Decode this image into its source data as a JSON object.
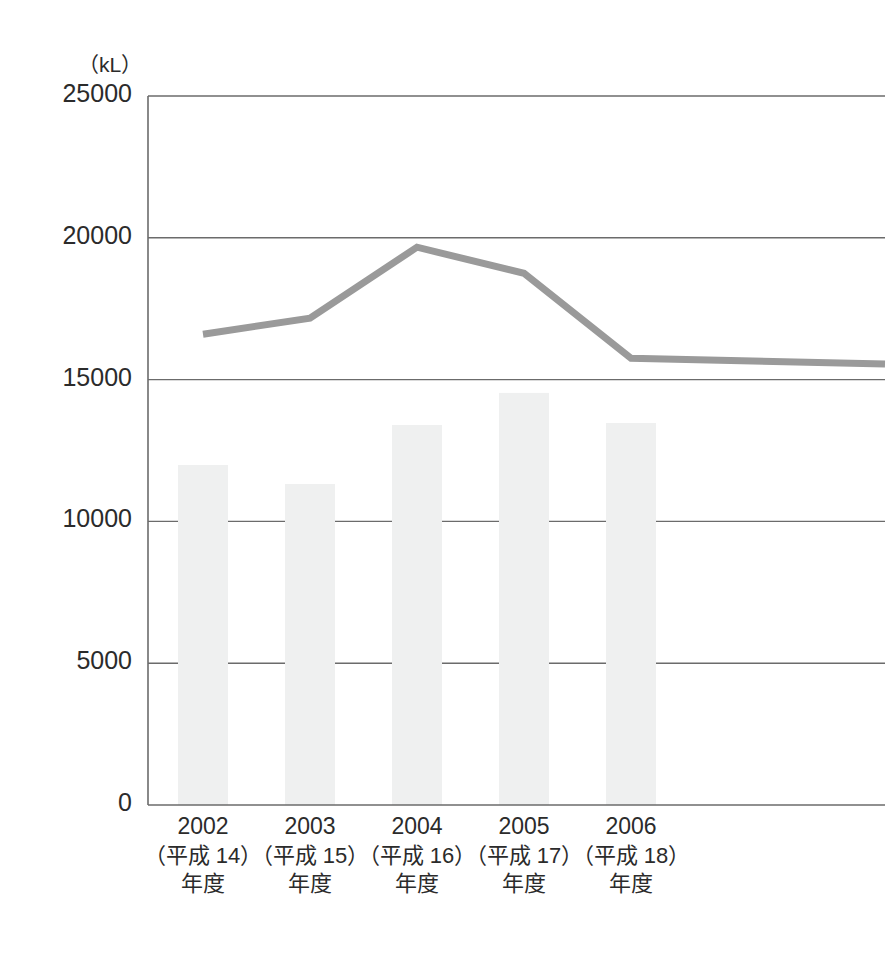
{
  "chart_data": {
    "type": "bar",
    "title": "",
    "subtitle": "",
    "xlabel": "",
    "ylabel": "",
    "unit_label": "（kL）",
    "grid": true,
    "legend_position": "none",
    "ylim": [
      0,
      25000
    ],
    "ytick_values": [
      0,
      5000,
      10000,
      15000,
      20000,
      25000
    ],
    "ytick_labels": [
      "0",
      "5000",
      "10000",
      "15000",
      "20000",
      "25000"
    ],
    "categories": [
      "2002",
      "2003",
      "2004",
      "2005",
      "2006"
    ],
    "category_labels": [
      {
        "year": "2002",
        "era": "（平成 14）",
        "suffix": "年度"
      },
      {
        "year": "2003",
        "era": "（平成 15）",
        "suffix": "年度"
      },
      {
        "year": "2004",
        "era": "（平成 16）",
        "suffix": "年度"
      },
      {
        "year": "2005",
        "era": "（平成 17）",
        "suffix": "年度"
      },
      {
        "year": "2006",
        "era": "（平成 18）",
        "suffix": "年度"
      }
    ],
    "series": [
      {
        "name": "bars",
        "render": "bar",
        "color": "#eff0f0",
        "values": [
          11990,
          11320,
          13400,
          14530,
          13470
        ]
      },
      {
        "name": "line",
        "render": "line",
        "color": "#9a9a9a",
        "width": 7,
        "values": [
          16600,
          17170,
          19670,
          18750,
          15750
        ],
        "trailing_value": 15550
      }
    ],
    "colors": {
      "bar_fill": "#eff0f0",
      "line": "#9a9a9a",
      "axis": "#6b6b6b",
      "grid": "#6b6b6b",
      "text": "#2b2b2b",
      "background": "#ffffff"
    }
  }
}
